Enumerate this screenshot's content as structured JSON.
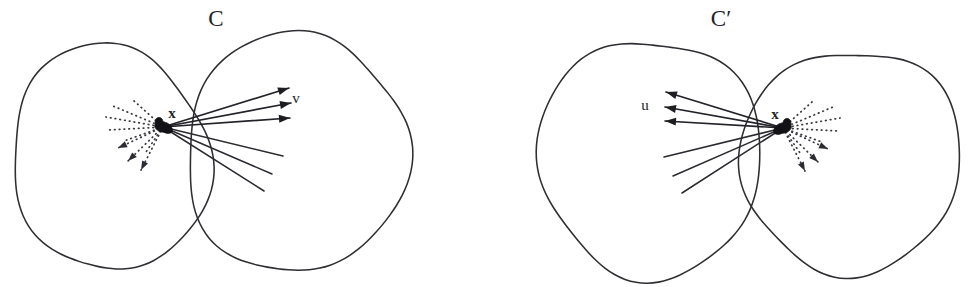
{
  "figure": {
    "type": "diagram",
    "background_color": "#ffffff",
    "stroke_color": "#2e2e33",
    "width": 974,
    "height": 287,
    "panels": [
      {
        "id": "panel-c",
        "set_label": "C",
        "set_label_x": 216,
        "set_label_y": 26,
        "point_label": "x",
        "point_label_x": 172,
        "point_label_y": 118,
        "vector_label": "v",
        "vector_label_x": 296,
        "vector_label_y": 103,
        "vertex_x": 163,
        "vertex_y": 127,
        "solid_fan_direction": "right",
        "dotted_fan_direction": "left",
        "blobs": [
          {
            "name": "left-blob",
            "cx": 110,
            "cy": 158,
            "rx": 98,
            "ry": 114,
            "rotate": -8
          },
          {
            "name": "right-blob",
            "cx": 296,
            "cy": 153,
            "rx": 110,
            "ry": 121,
            "rotate": 9
          }
        ],
        "arrow_rays": [
          {
            "x2": 289,
            "y2": 88
          },
          {
            "x2": 291,
            "y2": 103
          },
          {
            "x2": 290,
            "y2": 118
          }
        ],
        "plain_rays": [
          {
            "x2": 283,
            "y2": 156
          },
          {
            "x2": 272,
            "y2": 174
          },
          {
            "x2": 264,
            "y2": 191
          }
        ],
        "dotted_rays": [
          {
            "x2": 113,
            "y2": 106,
            "head": false
          },
          {
            "x2": 106,
            "y2": 117,
            "head": false
          },
          {
            "x2": 108,
            "y2": 130,
            "head": false
          },
          {
            "x2": 118,
            "y2": 148,
            "head": true
          },
          {
            "x2": 128,
            "y2": 161,
            "head": true
          },
          {
            "x2": 141,
            "y2": 170,
            "head": true
          },
          {
            "x2": 133,
            "y2": 100,
            "head": false
          },
          {
            "x2": 124,
            "y2": 141,
            "head": false
          },
          {
            "x2": 146,
            "y2": 152,
            "head": false
          }
        ]
      },
      {
        "id": "panel-c-prime",
        "set_label": "C′",
        "set_label_x": 721,
        "set_label_y": 26,
        "point_label": "x",
        "point_label_x": 775,
        "point_label_y": 119,
        "vector_label": "u",
        "vector_label_x": 645,
        "vector_label_y": 110,
        "vertex_x": 783,
        "vertex_y": 128,
        "solid_fan_direction": "left",
        "dotted_fan_direction": "right",
        "blobs": [
          {
            "name": "left-blob",
            "cx": 650,
            "cy": 158,
            "rx": 110,
            "ry": 121,
            "rotate": -9
          },
          {
            "name": "right-blob",
            "cx": 851,
            "cy": 161,
            "rx": 109,
            "ry": 113,
            "rotate": 8
          }
        ],
        "arrow_rays": [
          {
            "x2": 666,
            "y2": 92
          },
          {
            "x2": 665,
            "y2": 107
          },
          {
            "x2": 665,
            "y2": 121
          }
        ],
        "plain_rays": [
          {
            "x2": 664,
            "y2": 157
          },
          {
            "x2": 673,
            "y2": 176
          },
          {
            "x2": 682,
            "y2": 193
          }
        ],
        "dotted_rays": [
          {
            "x2": 833,
            "y2": 107,
            "head": false
          },
          {
            "x2": 840,
            "y2": 118,
            "head": false
          },
          {
            "x2": 838,
            "y2": 131,
            "head": false
          },
          {
            "x2": 828,
            "y2": 149,
            "head": true
          },
          {
            "x2": 818,
            "y2": 162,
            "head": true
          },
          {
            "x2": 805,
            "y2": 171,
            "head": true
          },
          {
            "x2": 813,
            "y2": 101,
            "head": false
          },
          {
            "x2": 822,
            "y2": 142,
            "head": false
          },
          {
            "x2": 800,
            "y2": 153,
            "head": false
          }
        ]
      }
    ]
  }
}
